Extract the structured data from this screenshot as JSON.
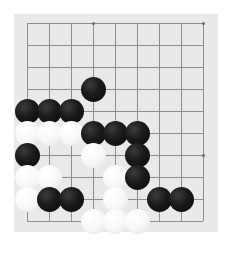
{
  "app": {
    "title": "Go Board",
    "board_label": "go-board"
  },
  "board": {
    "type": "go-board",
    "surface_color": "#e9e9e7",
    "line_color": "#8d8d8d",
    "black_stone_color": "#161616",
    "white_stone_color": "#fdfdfd",
    "visible_columns": 9,
    "visible_rows": 10,
    "origin_x": 27,
    "origin_y": 23,
    "spacing": 22,
    "stone_diameter": 25,
    "corner": "top-left",
    "star_points": [
      {
        "col": 3,
        "row": 0,
        "name": "star-point-top"
      },
      {
        "col": 8,
        "row": 0,
        "name": "star-point-top-right"
      },
      {
        "col": 3,
        "row": 6,
        "name": "star-point-center-left"
      },
      {
        "col": 8,
        "row": 6,
        "name": "star-point-center-right"
      }
    ],
    "stones": [
      {
        "col": 3,
        "row": 3,
        "color": "black"
      },
      {
        "col": 0,
        "row": 4,
        "color": "black"
      },
      {
        "col": 1,
        "row": 4,
        "color": "black"
      },
      {
        "col": 2,
        "row": 4,
        "color": "black"
      },
      {
        "col": 0,
        "row": 5,
        "color": "white"
      },
      {
        "col": 1,
        "row": 5,
        "color": "white"
      },
      {
        "col": 2,
        "row": 5,
        "color": "white"
      },
      {
        "col": 3,
        "row": 5,
        "color": "black"
      },
      {
        "col": 4,
        "row": 5,
        "color": "black"
      },
      {
        "col": 5,
        "row": 5,
        "color": "black"
      },
      {
        "col": 0,
        "row": 6,
        "color": "black"
      },
      {
        "col": 3,
        "row": 6,
        "color": "white"
      },
      {
        "col": 5,
        "row": 6,
        "color": "black"
      },
      {
        "col": 0,
        "row": 7,
        "color": "white"
      },
      {
        "col": 1,
        "row": 7,
        "color": "white"
      },
      {
        "col": 4,
        "row": 7,
        "color": "white"
      },
      {
        "col": 5,
        "row": 7,
        "color": "black"
      },
      {
        "col": 0,
        "row": 8,
        "color": "white"
      },
      {
        "col": 1,
        "row": 8,
        "color": "black"
      },
      {
        "col": 2,
        "row": 8,
        "color": "black"
      },
      {
        "col": 4,
        "row": 8,
        "color": "white"
      },
      {
        "col": 6,
        "row": 8,
        "color": "black"
      },
      {
        "col": 7,
        "row": 8,
        "color": "black"
      },
      {
        "col": 3,
        "row": 9,
        "color": "white"
      },
      {
        "col": 4,
        "row": 9,
        "color": "white"
      },
      {
        "col": 5,
        "row": 9,
        "color": "white"
      }
    ],
    "counts": {
      "black_stones": 14,
      "white_stones": 11,
      "total_stones": 25
    }
  }
}
